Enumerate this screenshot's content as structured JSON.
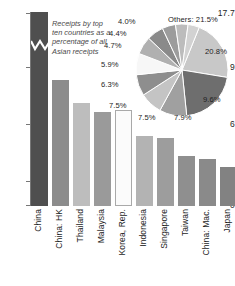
{
  "chart_data": {
    "type": "bar",
    "title": "",
    "annotation": "Receipts by top ten countries as a percentage of all Asian receipts",
    "xlabel": "",
    "ylabel": "",
    "ylim": [
      0,
      9.6
    ],
    "axis_break": true,
    "axis_break_note": "China bar truncated; true value 17.7",
    "grid": false,
    "categories": [
      "China",
      "China: HK",
      "Thailand",
      "Malaysia",
      "Korea, Rep.",
      "Indonesia",
      "Singapore",
      "Taiwan",
      "China: Mac.",
      "Japan"
    ],
    "values": [
      17.7,
      9.6,
      7.9,
      7.5,
      7.5,
      6.3,
      5.9,
      4.7,
      4.4,
      4.0
    ],
    "bar_colors": [
      "#4f4f4f",
      "#8c8c8c",
      "#bdbdbd",
      "#9a9a9a",
      "#fbfbfb",
      "#b3b3b3",
      "#9d9d9d",
      "#8f8f8f",
      "#8a8a8a",
      "#828282"
    ],
    "ytick_labels": [
      "17.7",
      "9",
      "6",
      "3",
      "0"
    ],
    "ytick_values": [
      17.7,
      9,
      6,
      3,
      0
    ]
  },
  "pie_data": {
    "type": "pie",
    "title": "",
    "labels": [
      "Others: 21.5%",
      "20.8%",
      "9.6%",
      "7.9%",
      "7.5%",
      "7.5%",
      "6.3%",
      "5.9%",
      "4.7%",
      "4.4%",
      "4.0%"
    ],
    "slice_names": [
      "Others",
      "China",
      "China: HK",
      "Thailand",
      "Malaysia",
      "Korea, Rep.",
      "Indonesia",
      "Singapore",
      "Taiwan",
      "China: Mac.",
      "Japan"
    ],
    "values": [
      21.5,
      20.8,
      9.6,
      7.9,
      7.5,
      7.5,
      6.3,
      5.9,
      4.7,
      4.4,
      4.0
    ],
    "colors": [
      "#c8c8c8",
      "#6e6e6e",
      "#a0a0a0",
      "#c4c4c4",
      "#8e8e8e",
      "#f7f7f7",
      "#b0b0b0",
      "#8a8a8a",
      "#9c9c9c",
      "#bcbcbc",
      "#d2d2d2"
    ]
  },
  "axis": {
    "t0": "17.7",
    "t1": "9",
    "t2": "6",
    "t3": "3",
    "t4": "0"
  },
  "pie_labels": {
    "others": "Others: 21.5%",
    "p1": "20.8%",
    "p2": "9.6%",
    "p3": "7.9%",
    "p4": "7.5%",
    "p5": "7.5%",
    "p6": "6.3%",
    "p7": "5.9%",
    "p8": "4.7%",
    "p9": "4.4%",
    "p10": "4.0%"
  },
  "cats": {
    "c0": "China",
    "c1": "China: HK",
    "c2": "Thailand",
    "c3": "Malaysia",
    "c4": "Korea, Rep.",
    "c5": "Indonesia",
    "c6": "Singapore",
    "c7": "Taiwan",
    "c8": "China: Mac.",
    "c9": "Japan"
  },
  "note": {
    "text": "Receipts by top ten countries as a percentage of all Asian receipts"
  }
}
